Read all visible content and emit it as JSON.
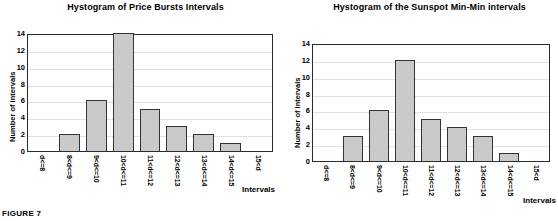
{
  "figure": {
    "caption": "FIGURE 7"
  },
  "charts": [
    {
      "title": "Hystogram of Price Bursts Intervals",
      "xlabel": "Intervals",
      "ylabel": "Number of intervals"
    },
    {
      "title": "Hystogram of the Sunspot Min-Min intervals",
      "xlabel": "Intervals",
      "ylabel": "Number of intervals"
    }
  ],
  "chart_data": [
    {
      "type": "bar",
      "title": "Hystogram of Price Bursts Intervals",
      "xlabel": "Intervals",
      "ylabel": "Number of intervals",
      "categories": [
        "d<=8",
        "8<d<=9",
        "9<d<=10",
        "10<d<=11",
        "11<d<=12",
        "12<d<=13",
        "13<d<=14",
        "14<d<=15",
        "15<d"
      ],
      "values": [
        0,
        2,
        6,
        14,
        5,
        3,
        2,
        1,
        0
      ],
      "ylim": [
        0,
        14
      ],
      "yticks": [
        0,
        2,
        4,
        6,
        8,
        10,
        12,
        14
      ],
      "grid": true,
      "legend": "none",
      "bar_color": "#c9c9c9",
      "bar_edge_color": "#333333"
    },
    {
      "type": "bar",
      "title": "Hystogram of the Sunspot Min-Min intervals",
      "xlabel": "Intervals",
      "ylabel": "Number of intervals",
      "categories": [
        "d<=8",
        "8<d<=9",
        "9<d<=10",
        "10<d<=11",
        "11<d<=12",
        "12<d<=13",
        "13<d<=14",
        "14<d<=15",
        "15<d"
      ],
      "values": [
        0,
        3,
        6,
        12,
        5,
        4,
        3,
        1,
        0
      ],
      "ylim": [
        0,
        14
      ],
      "yticks": [
        0,
        2,
        4,
        6,
        8,
        10,
        12,
        14
      ],
      "grid": true,
      "legend": "none",
      "bar_color": "#c9c9c9",
      "bar_edge_color": "#333333"
    }
  ]
}
